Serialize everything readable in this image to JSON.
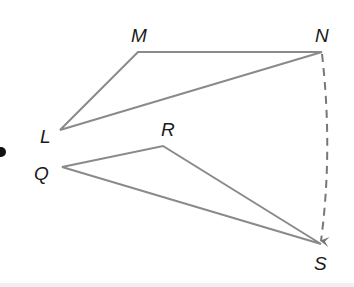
{
  "figure": {
    "colors": {
      "background": "#ffffff",
      "edge": "#8a8a8a",
      "arrow": "#777777",
      "label": "#1a1a1a"
    },
    "triangles": [
      {
        "name": "LMN",
        "vertices": [
          {
            "id": "L",
            "label": "L",
            "x": 60,
            "y": 130,
            "label_x": 40,
            "label_y": 143
          },
          {
            "id": "M",
            "label": "M",
            "x": 138,
            "y": 52,
            "label_x": 131,
            "label_y": 42
          },
          {
            "id": "N",
            "label": "N",
            "x": 322,
            "y": 52,
            "label_x": 315,
            "label_y": 42
          }
        ]
      },
      {
        "name": "QRS",
        "vertices": [
          {
            "id": "Q",
            "label": "Q",
            "x": 62,
            "y": 167,
            "label_x": 34,
            "label_y": 180
          },
          {
            "id": "R",
            "label": "R",
            "x": 163,
            "y": 146,
            "label_x": 161,
            "label_y": 136
          },
          {
            "id": "S",
            "label": "S",
            "x": 321,
            "y": 244,
            "label_x": 314,
            "label_y": 270
          }
        ]
      }
    ],
    "arrow": {
      "from": "N",
      "to": "S",
      "style": "dashed",
      "curved": true
    },
    "bullet": {
      "x": 1,
      "y": 152,
      "r": 5
    }
  }
}
